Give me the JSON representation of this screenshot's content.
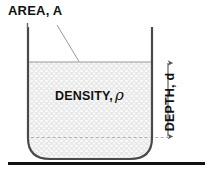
{
  "figure": {
    "type": "physics-diagram",
    "labels": {
      "area": "AREA, A",
      "density_prefix": "DENSITY,",
      "density_symbol": "ρ",
      "depth": "DEPTH, d"
    },
    "colors": {
      "liquid_fill": "#e9e9e9",
      "stipple": "#fdfdfd",
      "wall": "#4a4a4a",
      "surface_line": "#8a8a8a",
      "leader_line": "#8a8a8a",
      "dashed_line": "#a0a0a0",
      "arrow": "#555555",
      "ground": "#111111",
      "text": "#111111",
      "background": "#ffffff"
    },
    "geometry": {
      "container_left_x": 28,
      "container_right_x": 152,
      "container_top_y": 27,
      "container_bottom_y": 160,
      "corner_radius": 22,
      "liquid_surface_y": 62,
      "dashed_line_y": 137,
      "depth_arrow_x": 168,
      "depth_arrow_top_y": 62,
      "depth_arrow_bottom_y": 137,
      "ground_line_y": 163,
      "ground_line_x1": 8,
      "ground_line_x2": 205,
      "leader_from": [
        57,
        26
      ],
      "leader_to": [
        79,
        62
      ]
    }
  }
}
